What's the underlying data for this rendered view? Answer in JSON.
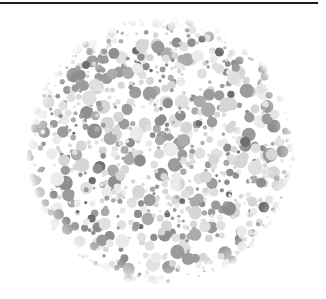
{
  "page": {
    "width": 326,
    "height": 299,
    "background_color": "#ffffff",
    "top_rule": {
      "name": "horizontal-rule",
      "color": "#1c1c1c",
      "x": 0,
      "y": 2,
      "width": 318,
      "thickness": 2
    },
    "caption_text": ""
  },
  "figure": {
    "type": "ishihara-plate",
    "title": "",
    "hidden_numeral_visible_in_grayscale": false,
    "disc": {
      "center_x": 161,
      "center_y": 143,
      "radius": 134,
      "cropped_at_bottom": true
    },
    "dot_palette": {
      "dark": "#6e6e6e",
      "mid_dark": "#8e8e8e",
      "mid": "#9b9b9b",
      "mid_light": "#ababab",
      "light": "#d6d6d6",
      "lighter": "#e0e0e0",
      "lightest": "#ebebeb",
      "background": "#ffffff"
    },
    "dot_size_range_px": [
      3,
      15
    ],
    "approx_dot_count": 900,
    "render": {
      "blur_px": 0.55,
      "rim_fade": true,
      "rng_seed": 20240917
    }
  }
}
